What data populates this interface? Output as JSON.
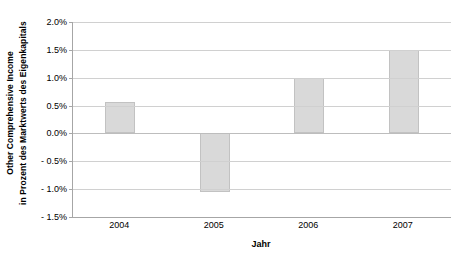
{
  "chart_data": {
    "type": "bar",
    "title": "",
    "subtitle": "",
    "categories": [
      "2004",
      "2005",
      "2006",
      "2007"
    ],
    "values": [
      0.57,
      -1.06,
      1.0,
      1.49
    ],
    "value_unit": "%",
    "xlabel": "Jahr",
    "ylabel_line1": "Other Comprehensive Income",
    "ylabel_line2": "in Prozent des Marktwerts des Eigenkapitals",
    "ylim": [
      -1.5,
      2.0
    ],
    "ytick_values": [
      2.0,
      1.5,
      1.0,
      0.5,
      0.0,
      -0.5,
      -1.0,
      -1.5
    ],
    "ytick_labels": [
      "2.0%",
      "1.5%",
      "1.0%",
      "0.5%",
      "0.0%",
      "- 0.5%",
      "- 1.0%",
      "- 1.5%"
    ],
    "grid": true,
    "legend": false,
    "legend_position": "none",
    "bar_fill_color": "#d9d9d9",
    "bar_border_color": "#c2c2c2",
    "gridline_color": "#d0d0d0",
    "axis_color": "#a6a6a6",
    "background_color": "#ffffff"
  }
}
